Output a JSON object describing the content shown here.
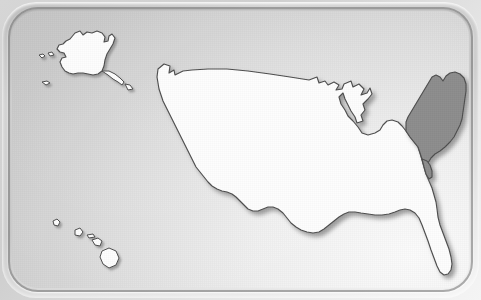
{
  "plaque": {
    "shape": "rounded-rectangle-beveled-plaque",
    "frame_color": "#cfcfcf",
    "background_color": "#dcdcdc",
    "groove_color": "#6e6e6e"
  },
  "map": {
    "title": "United States map",
    "projection_note": "contiguous United States with Alaska inset upper-left and Hawaii inset lower-left",
    "land_fill_color": "#fdfdfd",
    "outline_color": "#4e4e4e",
    "shadow_color": "#9a9a9a",
    "highlight_fill_color": "#8d8d8d",
    "selected_region_label": "Northeast",
    "regions": [
      {
        "name": "contiguous-united-states",
        "state": "default",
        "fill": "#fdfdfd"
      },
      {
        "name": "alaska",
        "state": "default",
        "fill": "#fdfdfd"
      },
      {
        "name": "hawaii",
        "state": "default",
        "fill": "#fdfdfd"
      },
      {
        "name": "northeast",
        "state": "selected",
        "fill": "#8d8d8d"
      }
    ]
  }
}
